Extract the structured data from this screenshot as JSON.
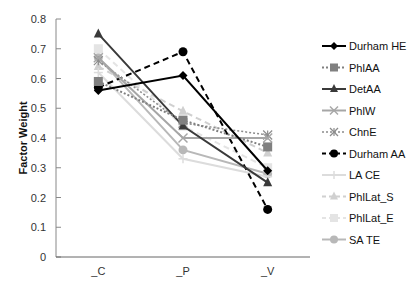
{
  "chart_data": {
    "type": "line",
    "title": "",
    "xlabel": "",
    "ylabel": "Factor Weight",
    "categories": [
      "_C",
      "_P",
      "_V"
    ],
    "ylim": [
      0,
      0.8
    ],
    "yticks": [
      0,
      0.1,
      0.2,
      0.3,
      0.4,
      0.5,
      0.6,
      0.7,
      0.8
    ],
    "ytick_labels": [
      "0",
      "0.1",
      "0.2",
      "0.3",
      "0.4",
      "0.5",
      "0.6",
      "0.7",
      "0.8"
    ],
    "grid": false,
    "legend_position": "right",
    "series": [
      {
        "name": "Durham HE",
        "values": [
          0.56,
          0.61,
          0.29
        ],
        "color": "#000000",
        "dash": "solid",
        "marker": "diamond",
        "width": 2
      },
      {
        "name": "PhlAA",
        "values": [
          0.59,
          0.46,
          0.37
        ],
        "color": "#808080",
        "dash": "dotted",
        "marker": "square",
        "width": 2
      },
      {
        "name": "DetAA",
        "values": [
          0.75,
          0.44,
          0.25
        ],
        "color": "#3a3a3a",
        "dash": "solid",
        "marker": "triangle",
        "width": 2
      },
      {
        "name": "PhlW",
        "values": [
          0.67,
          0.4,
          0.4
        ],
        "color": "#a6a6a6",
        "dash": "solid",
        "marker": "x",
        "width": 2
      },
      {
        "name": "ChnE",
        "values": [
          0.66,
          0.45,
          0.41
        ],
        "color": "#8c8c8c",
        "dash": "dotted",
        "marker": "star",
        "width": 1.5
      },
      {
        "name": "Durham AA",
        "values": [
          0.57,
          0.69,
          0.16
        ],
        "color": "#000000",
        "dash": "dashed",
        "marker": "circle",
        "width": 2
      },
      {
        "name": "LA CE",
        "values": [
          0.62,
          0.33,
          0.27
        ],
        "color": "#dcdcdc",
        "dash": "solid",
        "marker": "plus",
        "width": 2
      },
      {
        "name": "PhlLat_S",
        "values": [
          0.64,
          0.49,
          0.35
        ],
        "color": "#d0d0d0",
        "dash": "dashed",
        "marker": "triangle",
        "width": 2
      },
      {
        "name": "PhlLat_E",
        "values": [
          0.7,
          0.44,
          0.3
        ],
        "color": "#e4e4e4",
        "dash": "dashed",
        "marker": "square",
        "width": 2
      },
      {
        "name": "SA TE",
        "values": [
          0.67,
          0.36,
          0.28
        ],
        "color": "#b8b8b8",
        "dash": "solid",
        "marker": "circle",
        "width": 2
      }
    ]
  }
}
